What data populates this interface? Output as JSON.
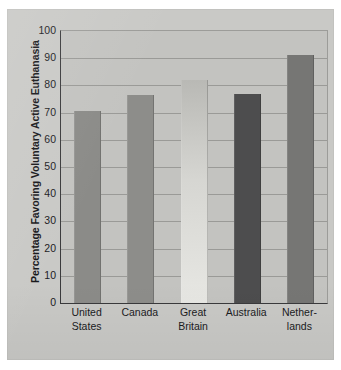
{
  "chart_data": {
    "type": "bar",
    "title": "",
    "xlabel": "",
    "ylabel": "Percentage Favoring Voluntary Active Euthanasia",
    "ylim": [
      0,
      100
    ],
    "yticks": [
      0,
      10,
      20,
      30,
      40,
      50,
      60,
      70,
      80,
      90,
      100
    ],
    "ytick_labels": [
      "0",
      "10",
      "20",
      "30",
      "40",
      "50",
      "60",
      "70",
      "80",
      "90",
      "100"
    ],
    "grid": true,
    "legend": "none",
    "categories": [
      "United States",
      "Canada",
      "Great Britain",
      "Australia",
      "Netherlands"
    ],
    "category_lines": [
      [
        "United",
        "States"
      ],
      [
        "Canada",
        ""
      ],
      [
        "Great",
        "Britain"
      ],
      [
        "Australia",
        ""
      ],
      [
        "Nether-",
        "lands"
      ]
    ],
    "values": [
      70.5,
      76.5,
      82,
      77,
      91
    ],
    "bar_colors": [
      "#8b8b88",
      "#8d8d8a",
      "#cfcfcb",
      "#4d4d4e",
      "#767674"
    ]
  },
  "colors": {
    "page_background": "#c9c9c6",
    "plot_background": "#c3c3c0",
    "axis": "#3a3a3c",
    "gridline": "#9a9a97",
    "text": "#1b1b1e"
  }
}
